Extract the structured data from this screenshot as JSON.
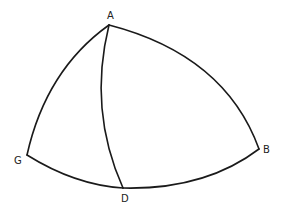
{
  "diagram": {
    "type": "spherical-triangle",
    "vertices": {
      "A": {
        "label": "A",
        "x": 109,
        "y": 25
      },
      "G": {
        "label": "G",
        "x": 27,
        "y": 155
      },
      "D": {
        "label": "D",
        "x": 123,
        "y": 188
      },
      "B": {
        "label": "B",
        "x": 259,
        "y": 149
      }
    },
    "edges": [
      {
        "from": "A",
        "to": "G"
      },
      {
        "from": "A",
        "to": "B"
      },
      {
        "from": "A",
        "to": "D"
      },
      {
        "from": "G",
        "to": "D"
      },
      {
        "from": "D",
        "to": "B"
      }
    ],
    "labels": {
      "A": "A",
      "G": "G",
      "D": "D",
      "B": "B"
    },
    "stroke_color": "#1a1a1a",
    "background_color": "#ffffff"
  }
}
